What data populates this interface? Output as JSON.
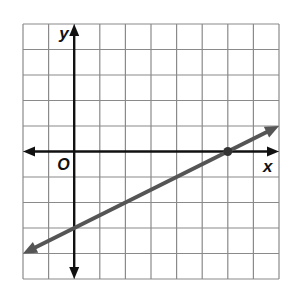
{
  "chart_data": {
    "type": "line",
    "title": "",
    "xlabel": "x",
    "ylabel": "y",
    "origin_label": "O",
    "grid": true,
    "xlim": [
      -2,
      8
    ],
    "ylim": [
      -5,
      5
    ],
    "tick_labels": false,
    "series": [
      {
        "name": "line",
        "equation": "y = 0.5x - 3",
        "slope": 0.5,
        "y_intercept": -3,
        "x_intercept": 6,
        "points": [
          [
            -2,
            -4
          ],
          [
            0,
            -3
          ],
          [
            6,
            0
          ],
          [
            8,
            1
          ]
        ],
        "marked_points": [
          [
            6,
            0
          ]
        ],
        "color": "#555555",
        "arrows_both_ends": true
      }
    ]
  },
  "colors": {
    "grid": "#8a8a8a",
    "axes": "#111111",
    "line": "#555555"
  }
}
